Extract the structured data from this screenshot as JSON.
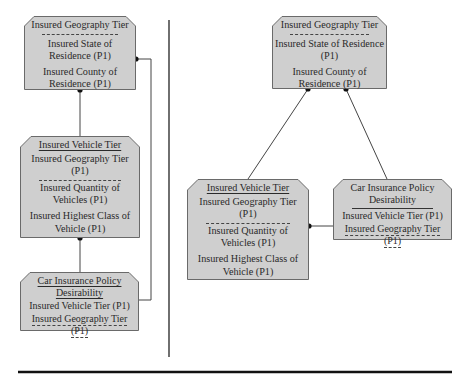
{
  "left_diagram": {
    "geography": {
      "title": "Insured Geography Tier",
      "attrs": [
        "Insured State of Residence (P1)",
        "Insured County of Residence (P1)"
      ]
    },
    "vehicle": {
      "title": "Insured Vehicle Tier",
      "key_attr": "Insured Geography Tier (P1)",
      "attrs": [
        "Insured Quantity of Vehicles (P1)",
        "Insured Highest Class of Vehicle (P1)"
      ]
    },
    "policy": {
      "title": "Car Insurance Policy Desirability",
      "attrs": [
        "Insured Vehicle Tier (P1)",
        "Insured Geography Tier (P1)"
      ]
    }
  },
  "right_diagram": {
    "geography": {
      "title": "Insured Geography Tier",
      "attrs": [
        "Insured State of Residence (P1)",
        "Insured County of Residence (P1)"
      ]
    },
    "vehicle": {
      "title": "Insured Vehicle Tier",
      "key_attr": "Insured Geography Tier (P1)",
      "attrs": [
        "Insured Quantity of Vehicles (P1)",
        "Insured Highest Class of Vehicle (P1)"
      ]
    },
    "policy": {
      "title": "Car Insurance Policy Desirability",
      "attrs": [
        "Insured Vehicle Tier (P1)",
        "Insured Geography Tier (P1)"
      ]
    }
  },
  "colors": {
    "box_fill": "#cfcfcf",
    "box_stroke": "#6a6a6a",
    "line": "#333333"
  }
}
